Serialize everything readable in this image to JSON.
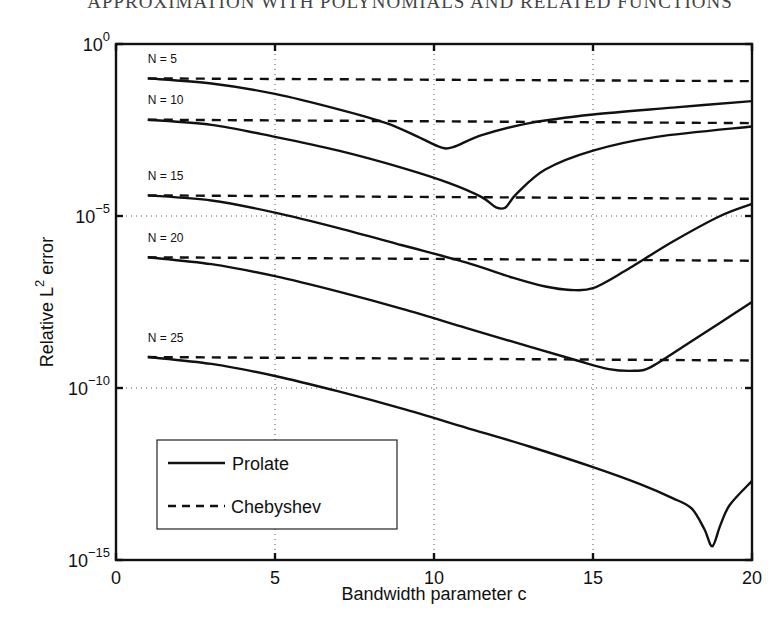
{
  "page_header": "APPROXIMATION WITH POLYNOMIALS AND RELATED FUNCTIONS",
  "chart_data": {
    "type": "line",
    "title": "",
    "xlabel": "Bandwidth parameter c",
    "ylabel": "Relative L² error",
    "ylabel_parts": {
      "before": "Relative L",
      "sup": "2",
      "after": " error"
    },
    "xscale": "linear",
    "yscale": "log",
    "xlim": [
      0,
      20
    ],
    "ylim_log10": [
      -15,
      0
    ],
    "x_ticks": [
      0,
      5,
      10,
      15,
      20
    ],
    "y_ticks": [
      {
        "base": "10",
        "exp": "0",
        "log10": 0
      },
      {
        "base": "10",
        "exp": "−5",
        "log10": -5
      },
      {
        "base": "10",
        "exp": "−10",
        "log10": -10
      },
      {
        "base": "10",
        "exp": "−15",
        "log10": -15
      }
    ],
    "grid": {
      "style": "dotted",
      "x": [
        5,
        10,
        15
      ],
      "y_log10": [
        -5,
        -10
      ]
    },
    "legend": {
      "position": "lower-left",
      "entries": [
        {
          "label": "Prolate",
          "style": "solid"
        },
        {
          "label": "Chebyshev",
          "style": "dashed"
        }
      ]
    },
    "series": [
      {
        "name": "Prolate",
        "N": 5,
        "label": "N = 5",
        "style": "solid",
        "x": [
          1,
          3,
          5,
          7,
          8.5,
          9.5,
          10.2,
          10.6,
          11.5,
          13,
          15,
          17.5,
          20
        ],
        "log10": [
          -1.0,
          -1.15,
          -1.45,
          -1.9,
          -2.3,
          -2.7,
          -3.0,
          -3.0,
          -2.65,
          -2.3,
          -2.05,
          -1.85,
          -1.66
        ]
      },
      {
        "name": "Chebyshev",
        "N": 5,
        "label": "N = 5",
        "style": "dashed",
        "x": [
          1,
          20
        ],
        "log10": [
          -1.0,
          -1.08
        ]
      },
      {
        "name": "Prolate",
        "N": 10,
        "label": "N = 10",
        "style": "solid",
        "x": [
          1,
          3,
          5,
          7,
          9,
          10.5,
          11.5,
          11.95,
          12.25,
          12.6,
          13.5,
          15,
          17,
          20
        ],
        "log10": [
          -2.2,
          -2.35,
          -2.7,
          -3.1,
          -3.6,
          -4.05,
          -4.45,
          -4.75,
          -4.75,
          -4.35,
          -3.65,
          -3.1,
          -2.7,
          -2.4
        ]
      },
      {
        "name": "Chebyshev",
        "N": 10,
        "label": "N = 10",
        "style": "dashed",
        "x": [
          1,
          20
        ],
        "log10": [
          -2.2,
          -2.3
        ]
      },
      {
        "name": "Prolate",
        "N": 15,
        "label": "N = 15",
        "style": "solid",
        "x": [
          1,
          3,
          5,
          7,
          9,
          11,
          12.5,
          13.5,
          14.3,
          15,
          16,
          17.5,
          19,
          20
        ],
        "log10": [
          -4.4,
          -4.55,
          -4.9,
          -5.35,
          -5.85,
          -6.35,
          -6.8,
          -7.05,
          -7.15,
          -7.1,
          -6.6,
          -5.75,
          -5.0,
          -4.65
        ]
      },
      {
        "name": "Chebyshev",
        "N": 15,
        "label": "N = 15",
        "style": "dashed",
        "x": [
          1,
          20
        ],
        "log10": [
          -4.4,
          -4.5
        ]
      },
      {
        "name": "Prolate",
        "N": 20,
        "label": "N = 20",
        "style": "solid",
        "x": [
          1,
          3,
          5,
          7,
          9,
          11,
          13,
          14.5,
          15.5,
          16.3,
          16.8,
          18,
          19,
          20
        ],
        "log10": [
          -6.2,
          -6.4,
          -6.75,
          -7.2,
          -7.7,
          -8.25,
          -8.8,
          -9.2,
          -9.45,
          -9.5,
          -9.4,
          -8.7,
          -8.1,
          -7.5
        ]
      },
      {
        "name": "Chebyshev",
        "N": 20,
        "label": "N = 20",
        "style": "dashed",
        "x": [
          1,
          20
        ],
        "log10": [
          -6.2,
          -6.3
        ]
      },
      {
        "name": "Prolate",
        "N": 25,
        "label": "N = 25",
        "style": "solid",
        "x": [
          1,
          3,
          5,
          7,
          9,
          11,
          13,
          15,
          16.5,
          17.5,
          18.1,
          18.5,
          18.75,
          19.0,
          19.3,
          20
        ],
        "log10": [
          -9.1,
          -9.3,
          -9.65,
          -10.1,
          -10.6,
          -11.15,
          -11.7,
          -12.3,
          -12.8,
          -13.2,
          -13.5,
          -14.1,
          -14.6,
          -14.0,
          -13.4,
          -12.7
        ]
      },
      {
        "name": "Chebyshev",
        "N": 25,
        "label": "N = 25",
        "style": "dashed",
        "x": [
          1,
          20
        ],
        "log10": [
          -9.1,
          -9.2
        ]
      }
    ],
    "n_labels": [
      {
        "text": "N = 5",
        "x": 1,
        "log10": -0.55
      },
      {
        "text": "N = 10",
        "x": 1,
        "log10": -1.75
      },
      {
        "text": "N = 15",
        "x": 1,
        "log10": -3.95
      },
      {
        "text": "N = 20",
        "x": 1,
        "log10": -5.75
      },
      {
        "text": "N = 25",
        "x": 1,
        "log10": -8.65
      }
    ]
  }
}
